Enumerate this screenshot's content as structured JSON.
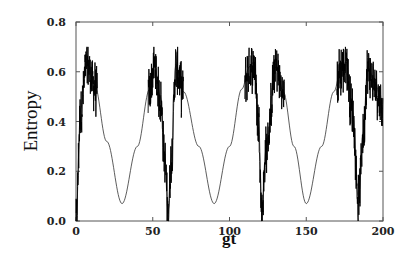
{
  "chart_data": {
    "type": "line",
    "title": "",
    "xlabel": "gt",
    "ylabel": "Entropy",
    "xlim": [
      0,
      200
    ],
    "ylim": [
      0,
      0.8
    ],
    "x_ticks": [
      0,
      50,
      100,
      150,
      200
    ],
    "x_tick_labels": [
      "0",
      "50",
      "100",
      "150",
      "200"
    ],
    "y_ticks": [
      0.0,
      0.2,
      0.4,
      0.6,
      0.8
    ],
    "y_tick_labels": [
      "0.0",
      "0.2",
      "0.4",
      "0.6",
      "0.8"
    ],
    "grid": false,
    "legend": null,
    "series": [
      {
        "name": "entropy",
        "style": "thin line with dense fast oscillations (noisy bursts) near peaks",
        "smooth_envelope": {
          "description": "smooth oscillation between ~0.07 and ~0.60, minima near gt=30, 90, 150",
          "min_value": 0.07,
          "max_value": 0.6,
          "minima_x": [
            30,
            90,
            150
          ]
        },
        "noisy_peaks": [
          {
            "x": 7,
            "y_max": 0.69
          },
          {
            "x": 51,
            "y_max": 0.68
          },
          {
            "x": 65,
            "y_max": 0.68
          },
          {
            "x": 116,
            "y_max": 0.69
          },
          {
            "x": 130,
            "y_max": 0.69
          },
          {
            "x": 176,
            "y_max": 0.69
          },
          {
            "x": 190,
            "y_max": 0.66
          }
        ],
        "sharp_dips": [
          {
            "x": 0,
            "y": 0.0
          },
          {
            "x": 60,
            "y": 0.03
          },
          {
            "x": 121,
            "y": 0.05
          },
          {
            "x": 184,
            "y": 0.09
          }
        ],
        "x": [
          0,
          3,
          7,
          12,
          20,
          30,
          40,
          48,
          51,
          55,
          58,
          60,
          62,
          65,
          70,
          80,
          90,
          100,
          108,
          113,
          116,
          119,
          121,
          124,
          130,
          135,
          142,
          150,
          160,
          168,
          173,
          176,
          180,
          184,
          187,
          190,
          195,
          200
        ],
        "y": [
          0.0,
          0.45,
          0.64,
          0.55,
          0.32,
          0.07,
          0.3,
          0.53,
          0.63,
          0.5,
          0.25,
          0.03,
          0.25,
          0.63,
          0.52,
          0.3,
          0.07,
          0.3,
          0.53,
          0.62,
          0.64,
          0.4,
          0.05,
          0.3,
          0.63,
          0.52,
          0.3,
          0.07,
          0.3,
          0.52,
          0.62,
          0.64,
          0.45,
          0.09,
          0.35,
          0.62,
          0.55,
          0.45
        ]
      }
    ]
  },
  "axes": {
    "xlabel": "gt",
    "ylabel": "Entropy",
    "x_tick_labels": [
      "0",
      "50",
      "100",
      "150",
      "200"
    ],
    "y_tick_labels": [
      "0.0",
      "0.2",
      "0.4",
      "0.6",
      "0.8"
    ]
  }
}
